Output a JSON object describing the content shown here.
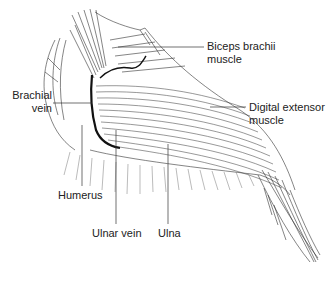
{
  "figure": {
    "labels": {
      "biceps": {
        "line1": "Biceps brachii",
        "line2": "muscle"
      },
      "brachial_vein": {
        "line1": "Brachial",
        "line2": "vein"
      },
      "digital_extensor": {
        "line1": "Digital extensor",
        "line2": "muscle"
      },
      "humerus": "Humerus",
      "ulnar_vein": "Ulnar vein",
      "ulna": "Ulna"
    },
    "colors": {
      "ink": "#1a1a1a",
      "background": "#ffffff",
      "leader": "#333333"
    }
  }
}
